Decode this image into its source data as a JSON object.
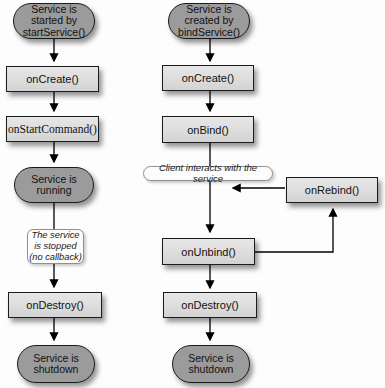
{
  "diagram": {
    "started_flow": {
      "start": "Service is\nstarted by\nstartService()",
      "on_create": "onCreate()",
      "on_start_command": "onStartCommand()",
      "running": "Service is\nrunning",
      "stopped_note": "The service\nis stopped\n(no callback)",
      "on_destroy": "onDestroy()",
      "shutdown": "Service is\nshutdown"
    },
    "bound_flow": {
      "start": "Service is\ncreated by\nbindService()",
      "on_create": "onCreate()",
      "on_bind": "onBind()",
      "client_note": "Client interacts with the service",
      "on_unbind": "onUnbind()",
      "on_rebind": "onRebind()",
      "on_destroy": "onDestroy()",
      "shutdown": "Service is\nshutdown"
    },
    "colors": {
      "state_fill": "#9b9b9b",
      "callback_fill": "#dddddd",
      "note_fill": "#fcfcfc",
      "node_border": "#1c1c1c",
      "note_border": "#8f8f8f",
      "arrow": "#000000"
    }
  }
}
